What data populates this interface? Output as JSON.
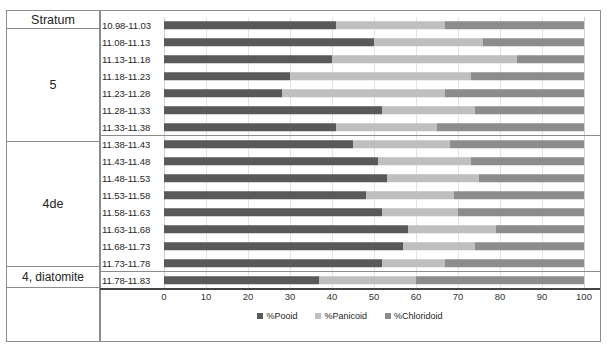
{
  "chart_data": {
    "type": "bar",
    "orientation": "horizontal",
    "stacked": true,
    "title": "",
    "xlabel": "",
    "ylabel": "",
    "xlim": [
      0,
      100
    ],
    "xticks": [
      0,
      10,
      20,
      30,
      40,
      50,
      60,
      70,
      80,
      90,
      100
    ],
    "grid": true,
    "legend_position": "bottom",
    "legend": [
      "%Pooid",
      "%Panicoid",
      "%Chloridoid"
    ],
    "colors": {
      "pooid": "#595959",
      "panicoid": "#bfbfbf",
      "chloridoid": "#8c8c8c"
    },
    "categories": [
      "10.98-11.03",
      "11.08-11.13",
      "11.13-11.18",
      "11.18-11.23",
      "11.23-11.28",
      "11.28-11.33",
      "11.33-11.38",
      "11.38-11.43",
      "11.43-11.48",
      "11.48-11.53",
      "11.53-11.58",
      "11.58-11.63",
      "11.63-11.68",
      "11.68-11.73",
      "11.73-11.78",
      "11.78-11.83"
    ],
    "series": [
      {
        "name": "%Pooid",
        "values": [
          41,
          50,
          40,
          30,
          28,
          52,
          41,
          45,
          51,
          53,
          48,
          52,
          58,
          57,
          52,
          37
        ]
      },
      {
        "name": "%Panicoid",
        "values": [
          26,
          26,
          44,
          43,
          39,
          22,
          24,
          23,
          22,
          22,
          21,
          18,
          21,
          17,
          15,
          23
        ]
      },
      {
        "name": "%Chloridoid",
        "values": [
          33,
          24,
          16,
          27,
          33,
          26,
          35,
          32,
          27,
          25,
          31,
          30,
          21,
          26,
          33,
          40
        ]
      }
    ]
  },
  "stratum_table": {
    "header": "Stratum",
    "groups": [
      {
        "label": "5",
        "rows": 7
      },
      {
        "label": "4de",
        "rows": 8
      },
      {
        "label": "4, diatomite",
        "rows": 1
      },
      {
        "label": "",
        "rows": 0
      }
    ]
  }
}
